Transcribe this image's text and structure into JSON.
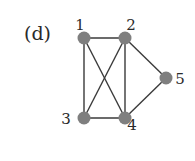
{
  "panel_label": "(d)",
  "graph": {
    "nodes": [
      {
        "id": "1",
        "label": "1",
        "x": 84,
        "y": 38,
        "label_x": 80,
        "label_y": 30
      },
      {
        "id": "2",
        "label": "2",
        "x": 125,
        "y": 38,
        "label_x": 131,
        "label_y": 30
      },
      {
        "id": "3",
        "label": "3",
        "x": 84,
        "y": 118,
        "label_x": 66,
        "label_y": 124
      },
      {
        "id": "4",
        "label": "4",
        "x": 125,
        "y": 118,
        "label_x": 132,
        "label_y": 130
      },
      {
        "id": "5",
        "label": "5",
        "x": 166,
        "y": 78,
        "label_x": 180,
        "label_y": 84
      }
    ],
    "edges": [
      [
        "1",
        "2"
      ],
      [
        "1",
        "3"
      ],
      [
        "1",
        "4"
      ],
      [
        "2",
        "3"
      ],
      [
        "2",
        "4"
      ],
      [
        "2",
        "5"
      ],
      [
        "3",
        "4"
      ],
      [
        "4",
        "5"
      ]
    ],
    "node_color": "#7f7f7f",
    "edge_color": "#3a3a3a"
  }
}
